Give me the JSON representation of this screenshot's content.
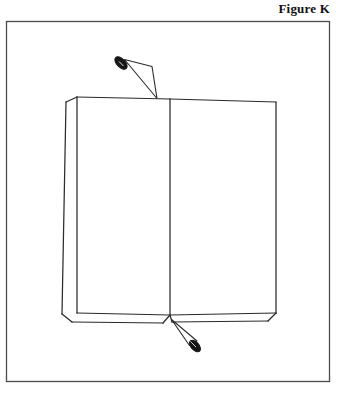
{
  "figure": {
    "caption": "Figure K",
    "style": "black-and-white-line-drawing"
  },
  "colors": {
    "background": "#ffffff",
    "ink": "#2b2b2b",
    "frame": "#4a4a4a",
    "nail_fill": "#161616",
    "caption": "#111111"
  },
  "frame": {
    "name": "illustration-border",
    "x": 6,
    "y": 21,
    "width": 324,
    "height": 361,
    "stroke_width": 1.3
  },
  "book": {
    "name": "open-book",
    "description": "An open book viewed from the front, two facing pages, spine running vertically down the middle, page-block thickness visible along the left and bottom edges.",
    "top_edge_y": 102,
    "bottom_face_y": 313,
    "bottom_block_y": 322,
    "left_inner_x": 76,
    "left_outer_top_x": 66,
    "left_outer_bottom_x": 62,
    "right_x": 276,
    "spine_x": 170,
    "stroke_width": 1.2
  },
  "nails": [
    {
      "name": "nail-top",
      "position": "upper-left, entering the top edge of the book near the spine",
      "head_x": 121,
      "head_y": 63,
      "tip_x": 156,
      "tip_y": 99,
      "head_angle_deg": 45,
      "head_radius_x": 7.5,
      "head_radius_y": 4.2
    },
    {
      "name": "nail-bottom",
      "position": "lower-right, tip touching the bottom edge of the book at the spine",
      "head_x": 195,
      "head_y": 346,
      "tip_x": 172,
      "tip_y": 320,
      "head_angle_deg": 48,
      "head_radius_x": 6.8,
      "head_radius_y": 4.0
    }
  ]
}
